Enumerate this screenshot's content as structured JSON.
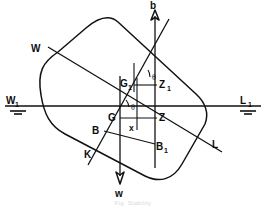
{
  "figure": {
    "caption": "Fig. Stability",
    "corner_mark": "",
    "background_color": "#ffffff",
    "ink_color": "#111111"
  },
  "labels": {
    "buoyancy_force": "b",
    "weight_force": "w",
    "waterline_left_upright": "W",
    "waterline_left_upright_sub": "1",
    "waterline_right_upright": "L",
    "waterline_right_upright_sub": "1",
    "waterline_left_inclined": "W",
    "waterline_right_inclined": "L",
    "keel": "K",
    "centre_gravity": "G",
    "centre_gravity_shifted": "G",
    "centre_gravity_shifted_sub": "1",
    "centre_buoyancy": "B",
    "centre_buoyancy_shifted": "B",
    "centre_buoyancy_shifted_sub": "1",
    "righting_point": "Z",
    "righting_point_upper": "Z",
    "righting_point_upper_sub": "1",
    "shift_distance": "x",
    "heel_angle_upper": "θ",
    "heel_angle_lower": "θ"
  },
  "geometry": {
    "hull_rotation_deg": -17,
    "upright_waterline_y": 106,
    "inclined_waterline_angle_deg": 17,
    "points": {
      "G": [
        120,
        118
      ],
      "G1": [
        137,
        85
      ],
      "B": [
        106,
        131
      ],
      "B1": [
        153,
        144
      ],
      "Z": [
        155,
        118
      ],
      "Z1": [
        155,
        85
      ],
      "K": [
        94,
        155
      ],
      "M": [
        155,
        27
      ]
    }
  },
  "annotations": {
    "upright_waterline_name": "W1L1",
    "inclined_waterline_name": "WL",
    "vertical_axis_name": "b-w force line"
  }
}
